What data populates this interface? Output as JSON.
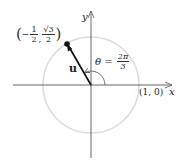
{
  "figure": {
    "type": "unit-circle-vector",
    "colors": {
      "axis": "#555555",
      "circle": "#d8d8d8",
      "vector": "#111111",
      "text": "#222222"
    },
    "axes": {
      "x_label": "x",
      "y_label": "y"
    },
    "point_label": {
      "open": "(",
      "x_sign": "−",
      "x_num": "1",
      "x_den": "2",
      "sep": ",",
      "y_num": "√3",
      "y_den": "2",
      "close": ")"
    },
    "angle_label": {
      "symbol": "θ",
      "equals": "=",
      "num": "2π",
      "den": "3"
    },
    "vector_label": "u",
    "x_intercept_label": "(1, 0)",
    "angle_degrees": 120
  }
}
